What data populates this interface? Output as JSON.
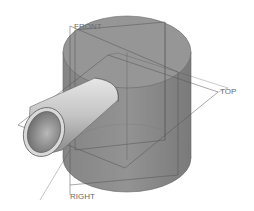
{
  "viewport": {
    "description": "Isometric CAD model view",
    "background": "#ffffff"
  },
  "model": {
    "main_body": "vertical cylinder",
    "feature": "horizontal hollow pipe protruding left",
    "body_color": "#8c8c8c",
    "body_top_color": "#959595",
    "pipe_color": "#c8c8c8",
    "edge_color": "#5a5a5a"
  },
  "datum_planes": [
    {
      "name": "FRONT",
      "label": "FRONT"
    },
    {
      "name": "TOP",
      "label": "TOP"
    },
    {
      "name": "RIGHT",
      "label": "RIGHT"
    }
  ]
}
